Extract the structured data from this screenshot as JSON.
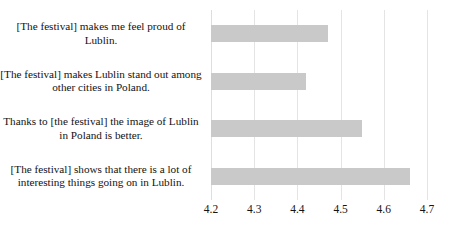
{
  "chart_data": {
    "type": "bar",
    "orientation": "horizontal",
    "title": "",
    "xlabel": "",
    "ylabel": "",
    "categories": [
      "[The festival] makes me feel proud of Lublin.",
      "[The festival] makes Lublin stand out among other cities in Poland.",
      "Thanks to [the festival] the image of Lublin in Poland is better.",
      "[The festival] shows that there is a lot of interesting things going on in Lublin."
    ],
    "values": [
      4.47,
      4.42,
      4.55,
      4.66
    ],
    "xlim": [
      4.2,
      4.7
    ],
    "xticks": [
      4.2,
      4.3,
      4.4,
      4.5,
      4.6,
      4.7
    ],
    "xtick_labels": [
      "4.2",
      "4.3",
      "4.4",
      "4.5",
      "4.6",
      "4.7"
    ],
    "grid": true,
    "grid_axis": "x",
    "legend": false,
    "bar_color": "#c9c9c9",
    "gridline_color": "#e4e4e4",
    "background_color": "#ffffff",
    "text_color": "#121212"
  }
}
